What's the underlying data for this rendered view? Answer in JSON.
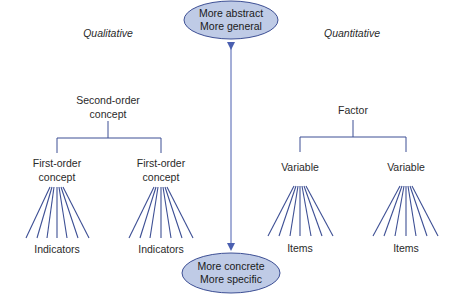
{
  "colors": {
    "line": "#3d4f94",
    "ellipse_fill": "#bfcbe6",
    "ellipse_stroke": "#3d4f94",
    "arrow": "#4a5fb0",
    "text": "#2a2a2a"
  },
  "header": {
    "left_label": "Qualitative",
    "right_label": "Quantitative"
  },
  "top_ellipse": {
    "line1": "More abstract",
    "line2": "More general"
  },
  "bottom_ellipse": {
    "line1": "More concrete",
    "line2": "More specific"
  },
  "qualitative_tree": {
    "root": {
      "line1": "Second-order",
      "line2": "concept"
    },
    "children": [
      {
        "line1": "First-order",
        "line2": "concept",
        "leaf_label": "Indicators"
      },
      {
        "line1": "First-order",
        "line2": "concept",
        "leaf_label": "Indicators"
      }
    ]
  },
  "quantitative_tree": {
    "root": {
      "label": "Factor"
    },
    "children": [
      {
        "label": "Variable",
        "leaf_label": "Items"
      },
      {
        "label": "Variable",
        "leaf_label": "Items"
      }
    ]
  }
}
